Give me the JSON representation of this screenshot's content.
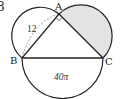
{
  "problem_number": "8",
  "points": {
    "A": "A",
    "B": "B",
    "C": "C"
  },
  "labels": {
    "ab_length": "12",
    "bc_semicircle_area": "40π"
  },
  "features": {
    "right_angle_at": "A",
    "shaded_region": "semicircle on AC",
    "dashed_arc": "from B to A inside semicircle on AB"
  },
  "colors": {
    "stroke": "#222222",
    "shade": "#e3e3e3",
    "dashed": "#888888",
    "background": "#ffffff"
  }
}
